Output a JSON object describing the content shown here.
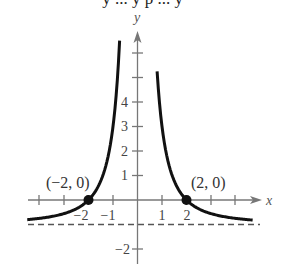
{
  "header": {
    "clipped_text": "y ... y p ... y"
  },
  "chart_data": {
    "type": "line",
    "title": "",
    "function": "y = 4/x^2 - 1",
    "xlabel": "x",
    "ylabel": "y",
    "xlim": [
      -4.6,
      4.8
    ],
    "ylim": [
      -2.5,
      7.0
    ],
    "x_ticks": [
      -4,
      -3,
      -2,
      -1,
      1,
      2,
      3,
      4
    ],
    "x_tick_labels": [
      "-2",
      "-1",
      "1",
      "2"
    ],
    "y_ticks": [
      -2,
      -1,
      1,
      2,
      3,
      4,
      5,
      6
    ],
    "y_tick_labels": [
      "-2",
      "1",
      "2",
      "3",
      "4"
    ],
    "asymptotes": {
      "horizontal": -1,
      "vertical": 0
    },
    "points": [
      {
        "x": -2,
        "y": 0,
        "label": "(−2, 0)"
      },
      {
        "x": 2,
        "y": 0,
        "label": "(2, 0)"
      }
    ],
    "grid": false,
    "colors": {
      "curve": "#111111",
      "axes": "#777777",
      "asymptote": "#555555"
    }
  },
  "labels": {
    "x_axis": "x",
    "y_axis": "y",
    "point_left": "(−2, 0)",
    "point_right": "(2, 0)",
    "xt_m2": "−2",
    "xt_m1": "−1",
    "xt_1": "1",
    "xt_2": "2",
    "yt_4": "4",
    "yt_3": "3",
    "yt_2": "2",
    "yt_1": "1",
    "yt_m2": "−2"
  }
}
